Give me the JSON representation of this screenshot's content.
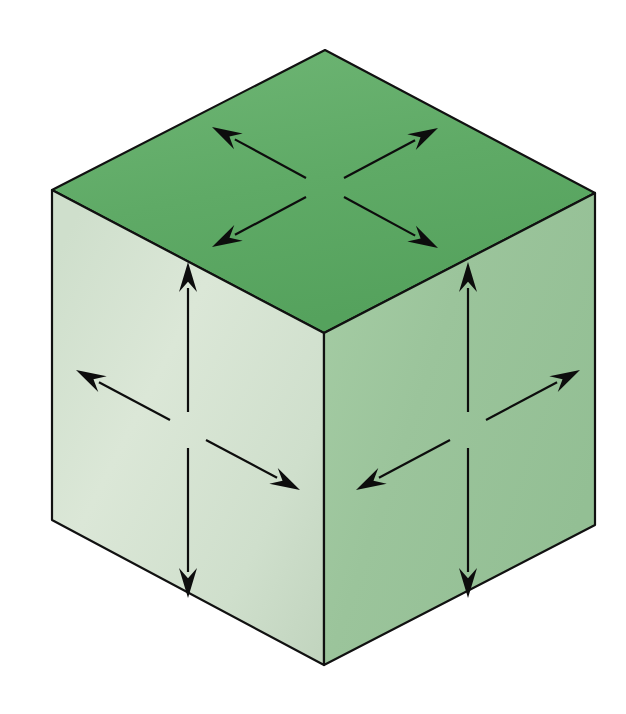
{
  "figure": {
    "background_color": "#ffffff",
    "width": 626,
    "height": 714
  },
  "cube": {
    "name": "isometric-cube",
    "outline_color": "#111111",
    "outline_width": 2.2,
    "vertices": {
      "top": [
        325,
        50
      ],
      "left": [
        52,
        190
      ],
      "right": [
        595,
        193
      ],
      "center": [
        324,
        333
      ],
      "bottom_left": [
        52,
        520
      ],
      "bottom_center": [
        324,
        665
      ],
      "bottom_right": [
        595,
        525
      ]
    },
    "faces": [
      {
        "name": "top-face",
        "label": "Top face",
        "points": "325,50 595,193 324,333 52,190",
        "fill": "#5faa66",
        "fill_light": "#6fb675",
        "fill_dark": "#4f9a58"
      },
      {
        "name": "left-face",
        "label": "Left face",
        "points": "52,190 324,333 324,665 52,520",
        "fill": "#cfdfcc",
        "fill_light": "#dde9da",
        "fill_dark": "#bed2bb"
      },
      {
        "name": "right-face",
        "label": "Right face",
        "points": "324,333 595,193 595,525 324,665",
        "fill": "#9bc49b",
        "fill_light": "#a9cea8",
        "fill_dark": "#8cb98d"
      }
    ]
  },
  "arrows": {
    "color": "#0d0d0d",
    "shaft_width": 2.2,
    "head_length": 30,
    "head_half_width": 9,
    "groups": [
      {
        "face": "top-face",
        "name": "top-face-arrows",
        "origin": [
          324,
          187
        ],
        "items": [
          {
            "name": "arrow-top-upper-left",
            "direction": "upper-left",
            "from": [
              306,
              178
            ],
            "to": [
              212,
              127
            ]
          },
          {
            "name": "arrow-top-upper-right",
            "direction": "upper-right",
            "from": [
              344,
              178
            ],
            "to": [
              438,
              128
            ]
          },
          {
            "name": "arrow-top-lower-left",
            "direction": "lower-left",
            "from": [
              306,
              197
            ],
            "to": [
              212,
              247
            ]
          },
          {
            "name": "arrow-top-lower-right",
            "direction": "lower-right",
            "from": [
              344,
              197
            ],
            "to": [
              438,
              248
            ]
          }
        ]
      },
      {
        "face": "left-face",
        "name": "left-face-arrows",
        "origin": [
          188,
          430
        ],
        "items": [
          {
            "name": "arrow-left-up",
            "direction": "up",
            "from": [
              188,
              412
            ],
            "to": [
              188,
              262
            ]
          },
          {
            "name": "arrow-left-down",
            "direction": "down",
            "from": [
              188,
              448
            ],
            "to": [
              188,
              598
            ]
          },
          {
            "name": "arrow-left-outward",
            "direction": "upper-left",
            "from": [
              170,
              420
            ],
            "to": [
              76,
              370
            ]
          },
          {
            "name": "arrow-left-inward",
            "direction": "lower-right",
            "from": [
              206,
              440
            ],
            "to": [
              300,
              490
            ]
          }
        ]
      },
      {
        "face": "right-face",
        "name": "right-face-arrows",
        "origin": [
          468,
          430
        ],
        "items": [
          {
            "name": "arrow-right-up",
            "direction": "up",
            "from": [
              468,
              412
            ],
            "to": [
              468,
              262
            ]
          },
          {
            "name": "arrow-right-down",
            "direction": "down",
            "from": [
              468,
              448
            ],
            "to": [
              468,
              598
            ]
          },
          {
            "name": "arrow-right-outward",
            "direction": "upper-right",
            "from": [
              486,
              420
            ],
            "to": [
              580,
              370
            ]
          },
          {
            "name": "arrow-right-inward",
            "direction": "lower-left",
            "from": [
              450,
              440
            ],
            "to": [
              356,
              490
            ]
          }
        ]
      }
    ]
  }
}
